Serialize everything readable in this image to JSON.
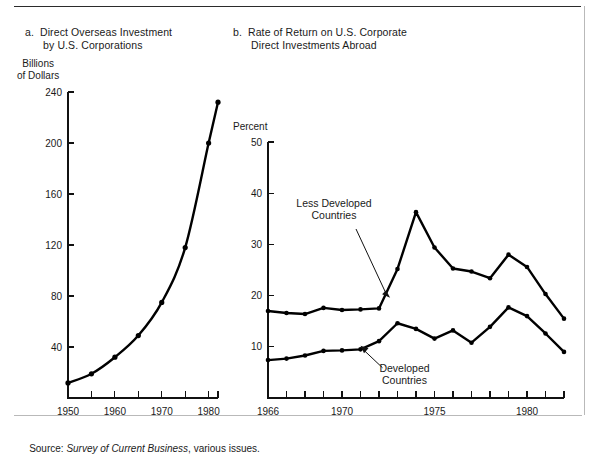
{
  "figure": {
    "source_prefix": "Source: ",
    "source_italic": "Survey of Current Business",
    "source_suffix": ", various issues."
  },
  "panel_a": {
    "title": "a.  Direct Overseas Investment\n      by U.S. Corporations",
    "y_caption": "Billions\nof Dollars"
  },
  "panel_b": {
    "title": "b.  Rate of Return on U.S. Corporate\n      Direct Investments Abroad",
    "y_caption": "Percent",
    "annotation_less_developed": "Less Developed",
    "annotation_less_developed_2": "Countries",
    "annotation_developed": "Developed",
    "annotation_developed_2": "Countries"
  },
  "chart_data": [
    {
      "type": "line",
      "panel": "a",
      "title": "a. Direct Overseas Investment by U.S. Corporations",
      "xlabel": "",
      "ylabel": "Billions of Dollars",
      "xlim": [
        1950,
        1982
      ],
      "ylim": [
        0,
        240
      ],
      "yticks": [
        40,
        80,
        120,
        160,
        200,
        240
      ],
      "ytick_labels": [
        "40",
        "80",
        "120",
        "160",
        "200",
        "240"
      ],
      "xticks": [
        1950,
        1955,
        1960,
        1965,
        1970,
        1975,
        1980,
        1982
      ],
      "xtick_labels": [
        "1950",
        "",
        "1960",
        "",
        "1970",
        "",
        "1980",
        ""
      ],
      "xtick_labeled": [
        1950,
        1960,
        1970,
        1980
      ],
      "grid": false,
      "legend": "none",
      "series": [
        {
          "name": "Direct Overseas Investment",
          "x": [
            1950,
            1955,
            1960,
            1965,
            1970,
            1975,
            1980,
            1982
          ],
          "values": [
            11.8,
            19,
            32,
            49,
            75,
            118,
            200,
            232
          ]
        }
      ]
    },
    {
      "type": "line",
      "panel": "b",
      "title": "b. Rate of Return on U.S. Corporate Direct Investments Abroad",
      "xlabel": "",
      "ylabel": "Percent",
      "xlim": [
        1966,
        1982
      ],
      "ylim": [
        0,
        50
      ],
      "yticks": [
        10,
        20,
        30,
        40,
        50
      ],
      "ytick_labels": [
        "10",
        "20",
        "30",
        "40",
        "50"
      ],
      "xticks": [
        1966,
        1967,
        1968,
        1969,
        1970,
        1971,
        1972,
        1973,
        1974,
        1975,
        1976,
        1977,
        1978,
        1979,
        1980,
        1981,
        1982
      ],
      "xtick_labeled": [
        1966,
        1970,
        1975,
        1980
      ],
      "grid": false,
      "legend": "annotated",
      "categories": [
        1966,
        1967,
        1968,
        1969,
        1970,
        1971,
        1972,
        1973,
        1974,
        1975,
        1976,
        1977,
        1978,
        1979,
        1980,
        1981,
        1982
      ],
      "series": [
        {
          "name": "Less Developed Countries",
          "x": [
            1966,
            1967,
            1968,
            1969,
            1970,
            1971,
            1972,
            1973,
            1974,
            1975,
            1976,
            1977,
            1978,
            1979,
            1980,
            1981,
            1982
          ],
          "values": [
            17.0,
            16.6,
            16.4,
            17.6,
            17.2,
            17.3,
            17.5,
            25.2,
            36.3,
            29.4,
            25.3,
            24.7,
            23.4,
            28.0,
            25.6,
            20.3,
            15.5
          ]
        },
        {
          "name": "Developed Countries",
          "x": [
            1966,
            1967,
            1968,
            1969,
            1970,
            1971,
            1972,
            1973,
            1974,
            1975,
            1976,
            1977,
            1978,
            1979,
            1980,
            1981,
            1982
          ],
          "values": [
            7.4,
            7.7,
            8.3,
            9.2,
            9.3,
            9.5,
            11.1,
            14.6,
            13.5,
            11.6,
            13.2,
            10.8,
            13.9,
            17.7,
            16.0,
            12.6,
            9.0
          ]
        }
      ]
    }
  ]
}
